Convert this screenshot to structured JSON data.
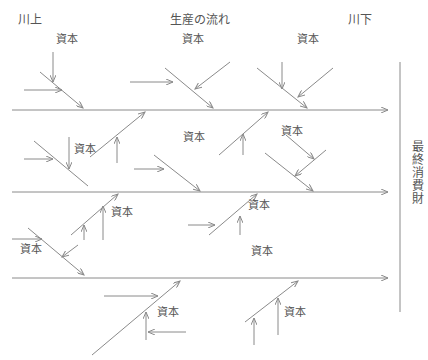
{
  "header": {
    "upstream": "川上",
    "flow": "生産の流れ",
    "downstream": "川下"
  },
  "final_goods": "最終消費財",
  "capital_label": "資本",
  "capital_labels": [
    {
      "x": 56,
      "y": 37
    },
    {
      "x": 182,
      "y": 37
    },
    {
      "x": 297,
      "y": 37
    },
    {
      "x": 74,
      "y": 147
    },
    {
      "x": 183,
      "y": 135
    },
    {
      "x": 281,
      "y": 129
    },
    {
      "x": 111,
      "y": 210
    },
    {
      "x": 248,
      "y": 203
    },
    {
      "x": 20,
      "y": 247
    },
    {
      "x": 251,
      "y": 249
    },
    {
      "x": 157,
      "y": 310
    },
    {
      "x": 284,
      "y": 310
    }
  ],
  "colors": {
    "line": "#8a8a8a",
    "text": "#555555"
  }
}
